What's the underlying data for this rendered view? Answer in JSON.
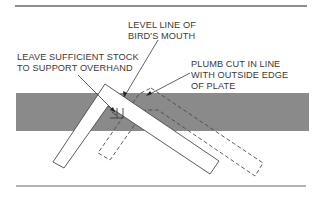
{
  "diagram": {
    "colors": {
      "plate_fill": "#8a8a8a",
      "line": "#4a4a4a",
      "square_fill": "#ffffff",
      "rule": "#6a6a6a",
      "text": "#3a3a3a"
    },
    "labels": {
      "level_line": [
        "LEVEL LINE OF",
        "BIRD'S MOUTH"
      ],
      "leave_stock": [
        "LEAVE SUFFICIENT STOCK",
        "TO SUPPORT OVERHAND"
      ],
      "plumb_cut": [
        "PLUMB CUT IN LINE",
        "WITH OUTSIDE EDGE",
        "OF PLATE"
      ]
    },
    "elements": [
      {
        "name": "rafter-plate",
        "description": "Gray horizontal band representing the rafter/plate"
      },
      {
        "name": "framing-square-solid",
        "description": "Framing square in first position (solid outline)"
      },
      {
        "name": "framing-square-dashed",
        "description": "Framing square in second position (dashed outline)"
      }
    ]
  }
}
